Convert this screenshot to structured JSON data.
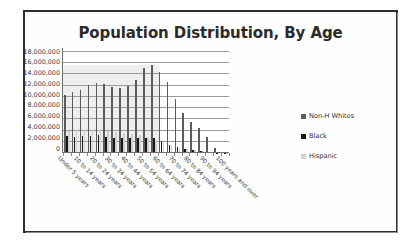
{
  "frame": {
    "border_color": "#2e2e2e",
    "background": "#ffffff"
  },
  "chart_data": {
    "type": "bar",
    "title": "Population Distribution, By Age",
    "xlabel": "",
    "ylabel": "",
    "ylim": [
      0,
      18000000
    ],
    "ytick_step": 2000000,
    "grid": true,
    "legend_position": "right",
    "categories": [
      "Under 5 years",
      "5 to 9 years",
      "10 to 14 years",
      "15 to 19 years",
      "20 to 24 years",
      "25 to 29 years",
      "30 to 34 years",
      "35 to 39 years",
      "40 to 44 years",
      "45 to 49 years",
      "50 to 54 years",
      "55 to 59 years",
      "60 to 64 years",
      "65 to 69 years",
      "70 to 74 years",
      "75 to 79 years",
      "80 to 84 years",
      "85 to 89 years",
      "90 to 94 years",
      "95 to 99 years",
      "100 years and over"
    ],
    "tick_labels": [
      "Under 5 years",
      "",
      "10 to 14 years",
      "",
      "20 to 24 years",
      "",
      "30 to 34 years",
      "",
      "40 to 44 years",
      "",
      "50 to 54 years",
      "",
      "60 to 64 years",
      "",
      "70 to 74 years",
      "",
      "80 to 84 years",
      "",
      "90 to 94 years",
      "",
      "100 years and over"
    ],
    "ytick_labels": [
      "18,000,000",
      "16,000,000",
      "14,000,000",
      "12,000,000",
      "10,000,000",
      "8,000,000",
      "6,000,000",
      "4,000,000",
      "2,000,000",
      "0"
    ],
    "series": [
      {
        "name": "Non-H Whites",
        "color": "#5b5b5b",
        "values": [
          10300000,
          10800000,
          11300000,
          12200000,
          12450000,
          12250000,
          11850000,
          11500000,
          11950000,
          13050000,
          15150000,
          15750000,
          14400000,
          12700000,
          9550000,
          7150000,
          5450000,
          4500000,
          2800000,
          900000,
          200000
        ]
      },
      {
        "name": "Black",
        "color": "#161616",
        "values": [
          2950000,
          2900000,
          2950000,
          3100000,
          3200000,
          2850000,
          2750000,
          2650000,
          2600000,
          2600000,
          2700000,
          2600000,
          2150000,
          1450000,
          1050000,
          800000,
          600000,
          420000,
          250000,
          90000,
          25000
        ]
      },
      {
        "name": "Hispanic",
        "color": "#cfcfcf",
        "values": [
          4000000,
          4100000,
          4050000,
          4150000,
          4300000,
          4000000,
          3800000,
          3600000,
          3400000,
          3200000,
          2900000,
          2350000,
          1800000,
          1300000,
          950000,
          700000,
          520000,
          350000,
          200000,
          70000,
          20000
        ]
      }
    ]
  }
}
